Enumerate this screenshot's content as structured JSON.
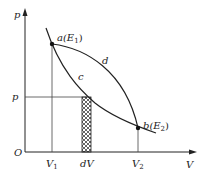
{
  "diagram": {
    "type": "p-V thermodynamic process diagram",
    "axes": {
      "y_label": "p",
      "x_label": "V",
      "origin_label": "O"
    },
    "points": [
      {
        "id": "a",
        "label": "a(E",
        "sub": "1",
        "close": ")"
      },
      {
        "id": "b",
        "label": "b(E",
        "sub": "2",
        "close": ")"
      }
    ],
    "curves": [
      {
        "id": "c",
        "label": "c"
      },
      {
        "id": "d",
        "label": "d"
      }
    ],
    "ticks": {
      "x": [
        {
          "label": "V",
          "sub": "1"
        },
        {
          "label": "dV",
          "sub": ""
        },
        {
          "label": "V",
          "sub": "2"
        }
      ],
      "y": [
        {
          "label": "p"
        }
      ]
    },
    "colors": {
      "line": "#222222",
      "hatch": "#222222",
      "background": "#ffffff"
    }
  }
}
